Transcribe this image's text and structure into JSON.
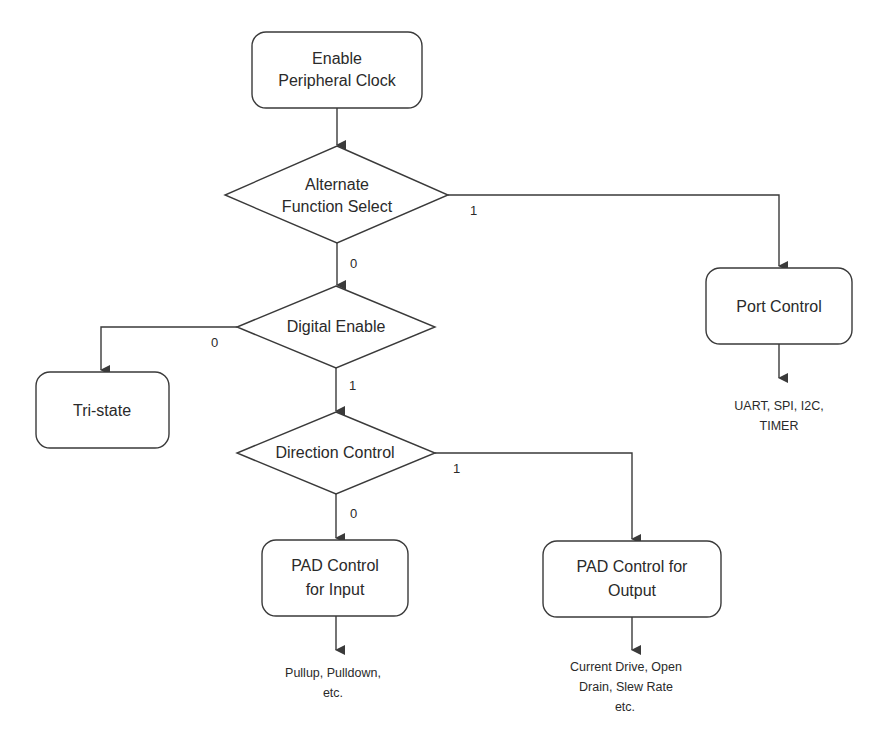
{
  "diagram": {
    "type": "flowchart",
    "colors": {
      "stroke": "#3a3a3a",
      "text": "#2a2a2a",
      "background": "#ffffff"
    },
    "nodes": {
      "enable_clock": {
        "shape": "rounded-rect",
        "lines": [
          "Enable",
          "Peripheral Clock"
        ]
      },
      "alt_func": {
        "shape": "diamond",
        "lines": [
          "Alternate",
          "Function Select"
        ]
      },
      "digital_enable": {
        "shape": "diamond",
        "lines": [
          "Digital Enable"
        ]
      },
      "tri_state": {
        "shape": "rounded-rect",
        "lines": [
          "Tri-state"
        ]
      },
      "direction": {
        "shape": "diamond",
        "lines": [
          "Direction Control"
        ]
      },
      "port_control": {
        "shape": "rounded-rect",
        "lines": [
          "Port Control"
        ]
      },
      "pad_input": {
        "shape": "rounded-rect",
        "lines": [
          "PAD Control",
          "for Input"
        ]
      },
      "pad_output": {
        "shape": "rounded-rect",
        "lines": [
          "PAD Control for",
          "Output"
        ]
      }
    },
    "notes": {
      "port_control": [
        "UART, SPI, I2C,",
        "TIMER"
      ],
      "pad_input": [
        "Pullup, Pulldown,",
        "etc."
      ],
      "pad_output": [
        "Current Drive, Open",
        "Drain, Slew Rate",
        "etc."
      ]
    },
    "edges": [
      {
        "from": "enable_clock",
        "to": "alt_func",
        "label": ""
      },
      {
        "from": "alt_func",
        "to": "port_control",
        "label": "1"
      },
      {
        "from": "alt_func",
        "to": "digital_enable",
        "label": "0"
      },
      {
        "from": "digital_enable",
        "to": "tri_state",
        "label": "0"
      },
      {
        "from": "digital_enable",
        "to": "direction",
        "label": "1"
      },
      {
        "from": "direction",
        "to": "pad_input",
        "label": "0"
      },
      {
        "from": "direction",
        "to": "pad_output",
        "label": "1"
      }
    ],
    "edge_labels": {
      "alt_to_port": "1",
      "alt_to_digital": "0",
      "digital_to_tristate": "0",
      "digital_to_direction": "1",
      "direction_to_input": "0",
      "direction_to_output": "1"
    }
  }
}
